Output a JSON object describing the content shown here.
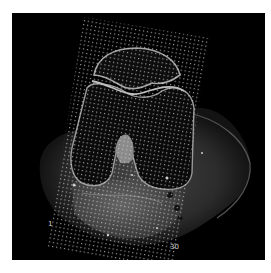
{
  "image": {
    "description": "Axial MRI of knee with slice-planning grid overlay",
    "background_color": "#000000"
  },
  "overlay": {
    "slice_count": 30,
    "first_slice_label": "1",
    "last_slice_label": "30",
    "grid_color": "#c8c8c8"
  }
}
